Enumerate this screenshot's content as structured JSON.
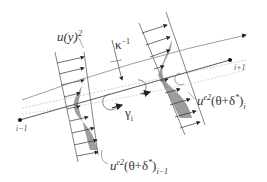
{
  "figure": {
    "labels": {
      "u_profile": "u(y)",
      "u_profile_sup": "2",
      "curvature": "κ",
      "curvature_sup": "−1",
      "gamma": "γ",
      "gamma_sub": "i",
      "node_prev": "i−1",
      "node_next": "i+1",
      "momentum_right": "u",
      "momentum_right_sup": "e2",
      "momentum_right_expr": "(θ+δ",
      "momentum_right_star": "*",
      "momentum_right_close": ")",
      "momentum_right_sub": "i",
      "momentum_left": "u",
      "momentum_left_sup": "e2",
      "momentum_left_expr": "(θ+δ",
      "momentum_left_star": "*",
      "momentum_left_close": ")",
      "momentum_left_sub": "i−1"
    },
    "colors": {
      "line": "#555555",
      "fill": "#8c8c8c",
      "dark": "#222222"
    }
  }
}
